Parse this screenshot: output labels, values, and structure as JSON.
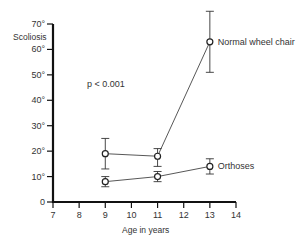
{
  "chart_data": {
    "type": "line",
    "title": "",
    "xlabel": "Age in years",
    "ylabel": "Scoliosis",
    "x_ticks": [
      7,
      8,
      9,
      10,
      11,
      12,
      13,
      14
    ],
    "y_ticks": [
      0,
      10,
      20,
      30,
      40,
      50,
      60,
      70
    ],
    "y_tick_labels": [
      "0",
      "10°",
      "20°",
      "30°",
      "40°",
      "50°",
      "60°",
      "70°"
    ],
    "xlim": [
      7,
      14
    ],
    "ylim": [
      0,
      70
    ],
    "grid": false,
    "legend": "inline labels at right end of each series",
    "annotations": [
      {
        "text": "p < 0.001",
        "x": 9.5,
        "y": 47
      }
    ],
    "series": [
      {
        "name": "Normal wheel chair",
        "x": [
          9,
          11,
          13
        ],
        "values": [
          19,
          18,
          63
        ],
        "error_low": [
          13,
          14,
          51
        ],
        "error_high": [
          25,
          21,
          75
        ]
      },
      {
        "name": "Orthoses",
        "x": [
          9,
          11,
          13
        ],
        "values": [
          8,
          10,
          14
        ],
        "error_low": [
          6,
          8,
          11
        ],
        "error_high": [
          10,
          12,
          17
        ]
      }
    ]
  },
  "labels": {
    "ylabel": "Scoliosis",
    "xlabel": "Age in years",
    "pvalue": "p < 0.001",
    "series_0": "Normal wheel chair",
    "series_1": "Orthoses"
  }
}
